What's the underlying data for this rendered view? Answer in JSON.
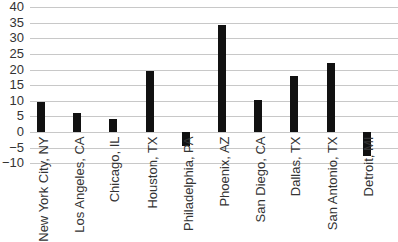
{
  "chart_data": {
    "type": "bar",
    "title": "",
    "xlabel": "",
    "ylabel": "",
    "ylim": [
      -10,
      40
    ],
    "yticks": [
      40,
      35,
      30,
      25,
      20,
      15,
      10,
      5,
      0,
      -5,
      -10
    ],
    "ytick_labels": [
      "40",
      "35",
      "30",
      "25",
      "20",
      "15",
      "10",
      "5",
      "0",
      "−5",
      "−10"
    ],
    "grid": true,
    "legend": null,
    "categories": [
      "New York City, NY",
      "Los Angeles, CA",
      "Chicago, IL",
      "Houston, TX",
      "Philadelphia, PA",
      "Phoenix, AZ",
      "San Diego, CA",
      "Dallas, TX",
      "San Antonio, TX",
      "Detroit, MI"
    ],
    "values": [
      9.5,
      6.1,
      4.1,
      19.7,
      -4.5,
      34.4,
      10.3,
      18.0,
      22.0,
      -7.7
    ],
    "bar_color": "#111111",
    "grid_color": "#c8c8c8"
  }
}
